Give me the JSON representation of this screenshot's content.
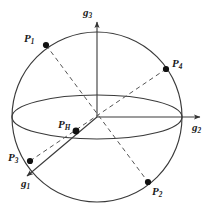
{
  "figure": {
    "type": "diagram",
    "background_color": "#ffffff",
    "stroke_color": "#333333",
    "dashed_color": "#555555",
    "text_color": "#1a1a1a"
  },
  "axes": [
    {
      "id": "g1",
      "base": "g",
      "sub": "1",
      "label_x": 21,
      "label_y": 178,
      "direction": "lower-left",
      "line_style": "solid",
      "arrow": true
    },
    {
      "id": "g2",
      "base": "g",
      "sub": "2",
      "label_x": 192,
      "label_y": 122,
      "direction": "right",
      "line_style": "solid",
      "arrow": true
    },
    {
      "id": "g3",
      "base": "g",
      "sub": "3",
      "label_x": 83,
      "label_y": 7,
      "direction": "up",
      "line_style": "solid",
      "arrow": true
    }
  ],
  "points": [
    {
      "id": "P1",
      "base": "P",
      "sub": "1",
      "label_x": 24,
      "label_y": 33,
      "dot_x": 46,
      "dot_y": 45
    },
    {
      "id": "P2",
      "base": "P",
      "sub": "2",
      "label_x": 152,
      "label_y": 186,
      "dot_x": 148,
      "dot_y": 182
    },
    {
      "id": "P3",
      "base": "P",
      "sub": "3",
      "label_x": 8,
      "label_y": 152,
      "dot_x": 30,
      "dot_y": 161
    },
    {
      "id": "P4",
      "base": "P",
      "sub": "4",
      "label_x": 172,
      "label_y": 58,
      "dot_x": 166,
      "dot_y": 69
    },
    {
      "id": "PH",
      "base": "P",
      "sub": "H",
      "label_x": 58,
      "label_y": 119,
      "dot_x": 76,
      "dot_y": 131
    }
  ],
  "chords": [
    {
      "id": "chord-P1-P2",
      "from": "P1",
      "to": "P2",
      "style": "dashed"
    },
    {
      "id": "chord-P3-P4",
      "from": "P3",
      "to": "P4",
      "style": "dashed"
    }
  ],
  "sphere": {
    "cx": 97,
    "cy": 117,
    "r": 85
  },
  "equator": {
    "cx": 97,
    "cy": 117,
    "rx": 85,
    "ry": 22
  }
}
